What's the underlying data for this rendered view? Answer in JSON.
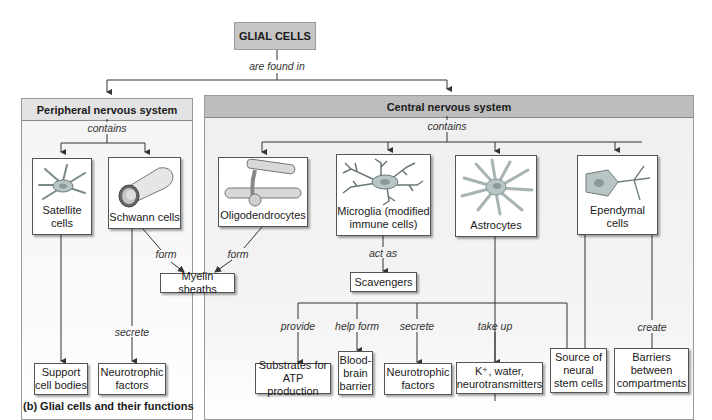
{
  "diagram": {
    "root": "GLIAL CELLS",
    "root_relation": "are found in",
    "caption": "(b) Glial cells and their functions",
    "colors": {
      "root_fill": "#c6c6c6",
      "pns_header": "#e3e3e3",
      "cns_header": "#bdbdbd",
      "panel_bg": "#f2f2f2",
      "line": "#333333"
    },
    "pns": {
      "title": "Peripheral nervous system",
      "relation": "contains",
      "cells": [
        {
          "label_1": "Satellite",
          "label_2": "cells",
          "icon": "satellite-cell-icon"
        },
        {
          "label_1": "Schwann cells",
          "icon": "schwann-cell-icon"
        }
      ],
      "functions": [
        {
          "label_1": "Support",
          "label_2": "cell bodies"
        },
        {
          "label_1": "Neurotrophic",
          "label_2": "factors",
          "verb": "secrete"
        }
      ],
      "schwann_form_verb": "form"
    },
    "cns": {
      "title": "Central nervous system",
      "relation": "contains",
      "cells": [
        {
          "label_1": "Oligodendrocytes",
          "icon": "oligodendrocyte-icon"
        },
        {
          "label_1": "Microglia (modified",
          "label_2": "immune cells)",
          "icon": "microglia-icon"
        },
        {
          "label_1": "Astrocytes",
          "icon": "astrocyte-icon"
        },
        {
          "label_1": "Ependymal",
          "label_2": "cells",
          "icon": "ependymal-cell-icon"
        }
      ],
      "oligo_form_verb": "form",
      "myelin": "Myelin sheaths",
      "microglia_verb": "act as",
      "scavengers": "Scavengers",
      "astro_functions": [
        {
          "verb": "provide",
          "label_1": "Substrates for",
          "label_2": "ATP production"
        },
        {
          "verb": "help form",
          "label_1": "Blood-",
          "label_2": "brain",
          "label_3": "barrier"
        },
        {
          "verb": "secrete",
          "label_1": "Neurotrophic",
          "label_2": "factors"
        },
        {
          "verb": "take up",
          "label_1": "K⁺, water,",
          "label_2": "neurotransmitters"
        }
      ],
      "stem": {
        "label_1": "Source of",
        "label_2": "neural",
        "label_3": "stem cells"
      },
      "ependymal_verb": "create",
      "barriers": {
        "label_1": "Barriers",
        "label_2": "between",
        "label_3": "compartments"
      }
    }
  }
}
